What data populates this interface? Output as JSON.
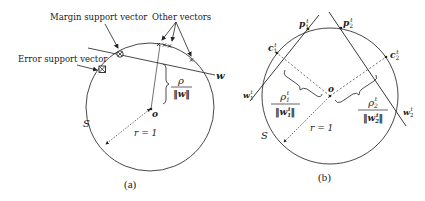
{
  "panel_a": {
    "caption": "(a)",
    "labels": {
      "margin_support_vector": "Margin support vector",
      "other_vectors": "Other vectors",
      "error_support_vector": "Error support vector",
      "w": "w",
      "rho": "ρ",
      "norm_w": "‖w‖",
      "origin": "o",
      "sphere": "S",
      "radius": "r = 1"
    }
  },
  "panel_b": {
    "caption": "(b)",
    "labels": {
      "p1": "p",
      "p1_sub": "1",
      "p1_sup": "t",
      "p2": "p",
      "p2_sub": "2",
      "p2_sup": "t",
      "c1": "c",
      "c1_sub": "1",
      "c1_sup": "t",
      "c2": "c",
      "c2_sub": "2",
      "c2_sup": "t",
      "w1": "w",
      "w1_sub": "1",
      "w1_sup": "t",
      "w2": "w",
      "w2_sub": "2",
      "w2_sup": "t",
      "rho1": "ρ",
      "rho1_sub": "1",
      "rho1_sup": "t",
      "rho2": "ρ",
      "rho2_sub": "2",
      "rho2_sup": "t",
      "norm_w1_open": "‖w",
      "norm_w1_sub": "1",
      "norm_w1_sup": "t",
      "norm_w1_close": "‖",
      "norm_w2_open": "‖w",
      "norm_w2_sub": "2",
      "norm_w2_sup": "t",
      "norm_w2_close": "‖",
      "origin": "o",
      "sphere": "S",
      "radius": "r = 1"
    }
  }
}
